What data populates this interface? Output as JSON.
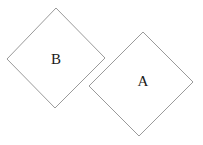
{
  "diagram": {
    "shapes": [
      {
        "id": "B",
        "label": "B",
        "type": "rotated-square",
        "points": "56,8 105,58 55,108 7,59",
        "label_pos": [
          56,
          61
        ]
      },
      {
        "id": "A",
        "label": "A",
        "type": "rotated-square",
        "points": "143,32 193,82 139,136 89,86",
        "label_pos": [
          143,
          83
        ]
      }
    ],
    "colors": {
      "stroke": "#9a9a9a",
      "fill": "#ffffff",
      "text": "#1a1a1a"
    }
  }
}
